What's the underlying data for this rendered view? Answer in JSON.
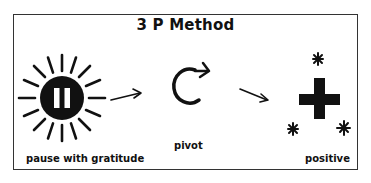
{
  "diagram": {
    "title": "3 P Method",
    "steps": [
      {
        "label": "pause with gratitude",
        "icon": "sun-pause-icon"
      },
      {
        "label": "pivot",
        "icon": "circular-arrow-icon"
      },
      {
        "label": "positive",
        "icon": "plus-sparkle-icon"
      }
    ],
    "connectors": [
      "arrow-right",
      "arrow-down-right"
    ],
    "colors": {
      "ink": "#111111",
      "background": "#ffffff",
      "border": "#333333"
    }
  }
}
